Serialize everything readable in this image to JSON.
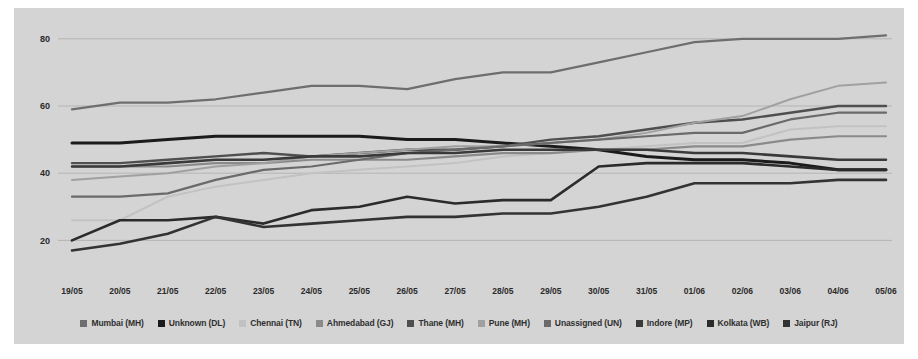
{
  "chart_data": {
    "type": "line",
    "title": "",
    "xlabel": "",
    "ylabel": "",
    "ylim": [
      10,
      85
    ],
    "yticks": [
      20,
      40,
      60,
      80
    ],
    "grid": true,
    "legend_position": "bottom",
    "x": [
      "19/05",
      "20/05",
      "21/05",
      "22/05",
      "23/05",
      "24/05",
      "25/05",
      "26/05",
      "27/05",
      "28/05",
      "29/05",
      "30/05",
      "31/05",
      "01/06",
      "02/06",
      "03/06",
      "04/06",
      "05/06"
    ],
    "series": [
      {
        "name": "Mumbai (MH)",
        "color": "#6e6e6e",
        "width": 2.2,
        "values": [
          59,
          61,
          61,
          62,
          64,
          66,
          66,
          65,
          68,
          70,
          70,
          73,
          76,
          79,
          80,
          80,
          80,
          81
        ]
      },
      {
        "name": "Unknown (DL)",
        "color": "#1b1b1b",
        "width": 3.0,
        "values": [
          49,
          49,
          50,
          51,
          51,
          51,
          51,
          50,
          50,
          49,
          48,
          47,
          45,
          44,
          44,
          43,
          41,
          41
        ]
      },
      {
        "name": "Chennai (TN)",
        "color": "#c2c2c2",
        "width": 2.0,
        "values": [
          26,
          26,
          33,
          36,
          38,
          40,
          41,
          42,
          43,
          45,
          46,
          47,
          48,
          49,
          49,
          53,
          54,
          54
        ]
      },
      {
        "name": "Ahmedabad (GJ)",
        "color": "#8a8a8a",
        "width": 2.2,
        "values": [
          42,
          42,
          42,
          43,
          43,
          44,
          44,
          44,
          45,
          46,
          46,
          47,
          47,
          48,
          48,
          50,
          51,
          51
        ]
      },
      {
        "name": "Thane (MH)",
        "color": "#4f4f4f",
        "width": 2.4,
        "values": [
          43,
          43,
          44,
          45,
          46,
          45,
          46,
          47,
          47,
          48,
          50,
          51,
          53,
          55,
          56,
          58,
          60,
          60
        ]
      },
      {
        "name": "Pune (MH)",
        "color": "#a0a0a0",
        "width": 2.0,
        "values": [
          38,
          39,
          40,
          42,
          43,
          45,
          46,
          47,
          48,
          48,
          49,
          50,
          52,
          55,
          57,
          62,
          66,
          67
        ]
      },
      {
        "name": "Unassigned (UN)",
        "color": "#6a6a6a",
        "width": 2.2,
        "values": [
          33,
          33,
          34,
          38,
          41,
          42,
          44,
          46,
          47,
          48,
          49,
          50,
          51,
          52,
          52,
          56,
          58,
          58
        ]
      },
      {
        "name": "Indore (MP)",
        "color": "#3a3a3a",
        "width": 2.6,
        "values": [
          42,
          42,
          43,
          44,
          44,
          45,
          45,
          46,
          46,
          47,
          47,
          47,
          47,
          46,
          46,
          45,
          44,
          44
        ]
      },
      {
        "name": "Kolkata (WB)",
        "color": "#2b2b2b",
        "width": 2.6,
        "values": [
          20,
          26,
          26,
          27,
          25,
          29,
          30,
          33,
          31,
          32,
          32,
          42,
          43,
          43,
          43,
          42,
          41,
          41
        ]
      },
      {
        "name": "Jaipur (RJ)",
        "color": "#333333",
        "width": 2.6,
        "values": [
          17,
          19,
          22,
          27,
          24,
          25,
          26,
          27,
          27,
          28,
          28,
          30,
          33,
          37,
          37,
          37,
          38,
          38
        ]
      }
    ]
  },
  "axis": {
    "ytick_labels": [
      "80",
      "60",
      "40",
      "20"
    ],
    "xtick_labels": [
      "19/05",
      "20/05",
      "21/05",
      "22/05",
      "23/05",
      "24/05",
      "25/05",
      "26/05",
      "27/05",
      "28/05",
      "29/05",
      "30/05",
      "31/05",
      "01/06",
      "02/06",
      "03/06",
      "04/06",
      "05/06"
    ]
  }
}
